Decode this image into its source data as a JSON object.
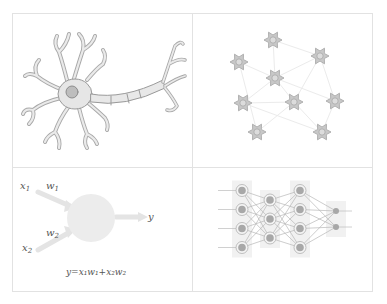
{
  "figure": {
    "panels": [
      {
        "id": "biological-neuron",
        "description": "Single biological neuron with dendrites, soma, axon and axon terminals"
      },
      {
        "id": "biological-network",
        "description": "Network of interconnected biological neurons",
        "neurons": [
          [
            273,
            40
          ],
          [
            239,
            62
          ],
          [
            320,
            56
          ],
          [
            275,
            78
          ],
          [
            243,
            103
          ],
          [
            294,
            102
          ],
          [
            335,
            101
          ],
          [
            257,
            132
          ],
          [
            322,
            132
          ]
        ]
      },
      {
        "id": "artificial-neuron",
        "description": "Artificial neuron (perceptron) with two weighted inputs",
        "labels": {
          "x1": "x",
          "x1_sub": "1",
          "x2": "x",
          "x2_sub": "2",
          "w1": "w",
          "w1_sub": "1",
          "w2": "w",
          "w2_sub": "2",
          "y": "y"
        },
        "formula": "y=x₁w₁+x₂w₂"
      },
      {
        "id": "artificial-network",
        "description": "Feed-forward artificial neural network",
        "layers": [
          4,
          3,
          4,
          2
        ]
      }
    ],
    "colors": {
      "border": "#e2e2e2",
      "sketch": "#9a9a9a",
      "fill": "#e6e6e6",
      "node": "#a0a0a0"
    }
  }
}
